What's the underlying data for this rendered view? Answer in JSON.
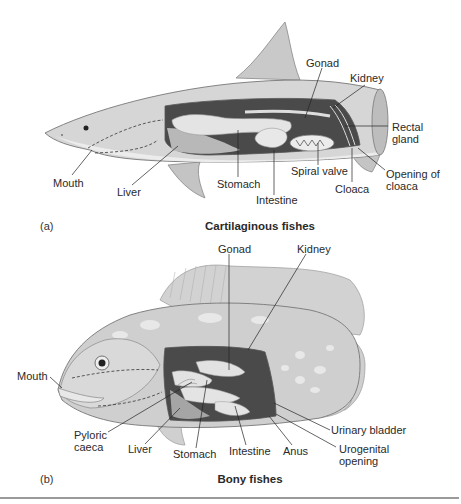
{
  "panels": [
    {
      "tag": "(a)",
      "caption": "Cartilaginous fishes",
      "labels": {
        "mouth": "Mouth",
        "liver": "Liver",
        "stomach": "Stomach",
        "intestine": "Intestine",
        "spiral_valve": "Spiral valve",
        "cloaca": "Cloaca",
        "opening_of_cloaca": "Opening of\ncloaca",
        "rectal_gland": "Rectal\ngland",
        "kidney": "Kidney",
        "gonad": "Gonad"
      }
    },
    {
      "tag": "(b)",
      "caption": "Bony fishes",
      "labels": {
        "gonad": "Gonad",
        "kidney": "Kidney",
        "mouth": "Mouth",
        "pyloric_caeca": "Pyloric\ncaeca",
        "liver": "Liver",
        "stomach": "Stomach",
        "intestine": "Intestine",
        "anus": "Anus",
        "urinary_bladder": "Urinary bladder",
        "urogenital_opening": "Urogenital\nopening"
      }
    }
  ],
  "colors": {
    "body_fill": "#d4d4d4",
    "body_dark": "#a8a8a8",
    "cavity_dark": "#4a4a4a",
    "organ_fill": "#e6e6e6",
    "leader": "#222222",
    "rule": "#9a9a9a"
  }
}
